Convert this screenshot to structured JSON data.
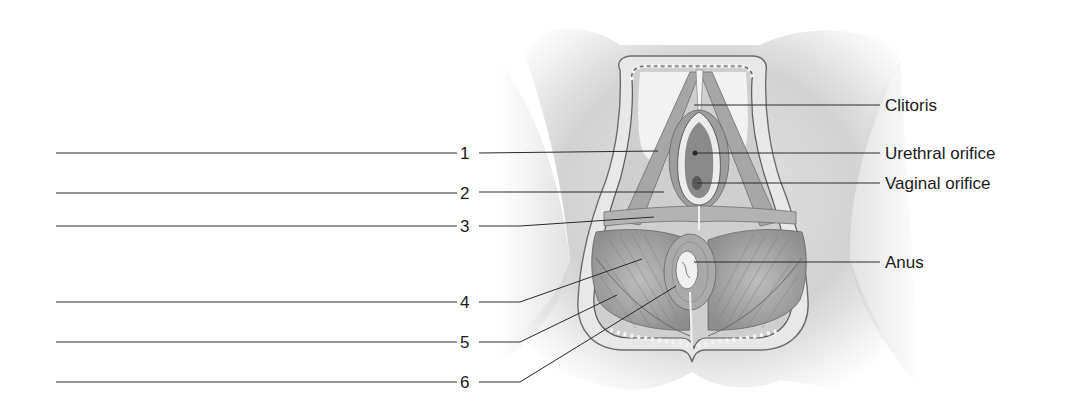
{
  "diagram": {
    "numbered_labels": [
      {
        "number": "1",
        "answer": ""
      },
      {
        "number": "2",
        "answer": ""
      },
      {
        "number": "3",
        "answer": ""
      },
      {
        "number": "4",
        "answer": ""
      },
      {
        "number": "5",
        "answer": ""
      },
      {
        "number": "6",
        "answer": ""
      }
    ],
    "named_labels": [
      {
        "text": "Clitoris"
      },
      {
        "text": "Urethral orifice"
      },
      {
        "text": "Vaginal orifice"
      },
      {
        "text": "Anus"
      }
    ]
  }
}
